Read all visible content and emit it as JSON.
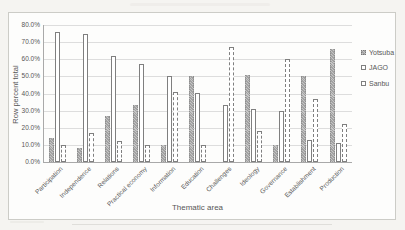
{
  "chart_data": {
    "type": "bar",
    "xlabel": "Thematic area",
    "ylabel": "Row percent total",
    "ylim": [
      0,
      80
    ],
    "ytick_step": 10,
    "yticks": [
      "80.0%",
      "70.0%",
      "60.0%",
      "50.0%",
      "40.0%",
      "30.0%",
      "20.0%",
      "10.0%",
      "0.0%"
    ],
    "grid": true,
    "legend_position": "right",
    "categories": [
      "Participation",
      "Independence",
      "Relations",
      "Practical economy",
      "Information",
      "Education",
      "Challenges",
      "Ideology",
      "Governance",
      "Establishment",
      "Production"
    ],
    "series": [
      {
        "name": "Yotsuba",
        "style": "gray-pattern-fill",
        "values": [
          14,
          8,
          27,
          33,
          10,
          50,
          0,
          51,
          10,
          50,
          66
        ]
      },
      {
        "name": "JAGO",
        "style": "white-solid-outline",
        "values": [
          76,
          75,
          62,
          57,
          50,
          40,
          33,
          31,
          30,
          13,
          11
        ]
      },
      {
        "name": "Sanbu",
        "style": "white-dashed-outline",
        "values": [
          10,
          17,
          12,
          10,
          41,
          10,
          67,
          18,
          60,
          37,
          22
        ]
      }
    ],
    "colors": {
      "bar_gray": "#a2a2a2",
      "outline": "#7f7f7f",
      "gridline": "#dddddd",
      "axis": "#a9a9a9",
      "text": "#575757"
    }
  }
}
